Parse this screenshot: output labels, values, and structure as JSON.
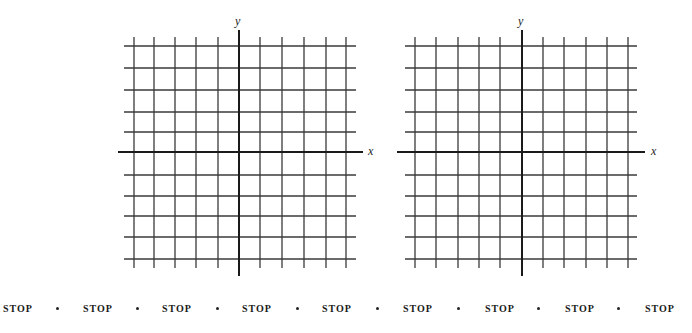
{
  "grids": [
    {
      "name": "left-coordinate-grid",
      "x_axis_label": "x",
      "y_axis_label": "y",
      "origin": [
        239,
        152
      ],
      "vertical_lines_x": [
        134,
        154,
        175,
        196,
        218,
        260,
        282,
        304,
        326,
        346
      ],
      "horizontal_lines_y": [
        46,
        68,
        90,
        112,
        132,
        175,
        196,
        216,
        237,
        259
      ],
      "grid_x_range": [
        124,
        356
      ],
      "grid_y_range": [
        37,
        268
      ],
      "x_axis_range": [
        118,
        363
      ],
      "y_axis_range": [
        30,
        276
      ],
      "x_label_pos": [
        368,
        145
      ],
      "y_label_pos": [
        235,
        15
      ]
    },
    {
      "name": "right-coordinate-grid",
      "x_axis_label": "x",
      "y_axis_label": "y",
      "origin": [
        522,
        152
      ],
      "vertical_lines_x": [
        415,
        436,
        458,
        479,
        500,
        543,
        564,
        586,
        607,
        628
      ],
      "horizontal_lines_y": [
        46,
        68,
        90,
        112,
        132,
        175,
        196,
        216,
        237,
        259
      ],
      "grid_x_range": [
        405,
        637
      ],
      "grid_y_range": [
        37,
        268
      ],
      "x_axis_range": [
        397,
        645
      ],
      "y_axis_range": [
        30,
        276
      ],
      "x_label_pos": [
        651,
        145
      ],
      "y_label_pos": [
        518,
        15
      ]
    }
  ],
  "stop_row": {
    "items": [
      "STOP",
      "STOP",
      "STOP",
      "STOP",
      "STOP",
      "STOP",
      "STOP",
      "STOP",
      "STOP"
    ],
    "item_x": [
      3,
      83,
      162,
      242,
      322,
      403,
      485,
      565,
      645
    ],
    "dot_x": [
      57,
      137,
      217,
      297,
      377,
      458,
      538,
      618
    ]
  },
  "colors": {
    "grid_line": "#3a3a3a",
    "axis_line": "#1a1a1a",
    "background": "#ffffff"
  }
}
